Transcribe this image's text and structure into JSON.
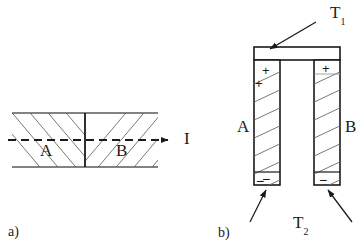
{
  "figure": {
    "title_present": false,
    "panels": [
      {
        "id": "a",
        "caption": "a)",
        "description": "horizontal two-segment hatched bar with current arrow",
        "labels": {
          "segment_left": "A",
          "segment_right": "B",
          "current": "I"
        },
        "arrow": {
          "name": "current-arrow",
          "direction": "right",
          "style": "dashed-with-solid-head"
        }
      },
      {
        "id": "b",
        "caption": "b)",
        "description": "U-shaped thermocouple with two vertical hatched legs joined by a horizontal bar at top",
        "labels": {
          "leg_left": "A",
          "leg_right": "B",
          "hot_junction": "T",
          "hot_junction_sub": "1",
          "cold_ends": "T",
          "cold_ends_sub": "2"
        },
        "polarity": {
          "top_left": "+",
          "top_left_second": "+",
          "top_right": "+",
          "bottom_left": "−",
          "bottom_left_second": "−",
          "bottom_right": "−"
        }
      }
    ],
    "colors": {
      "stroke": "#1a1a1a",
      "hatch": "#555555",
      "background": "#ffffff"
    }
  }
}
